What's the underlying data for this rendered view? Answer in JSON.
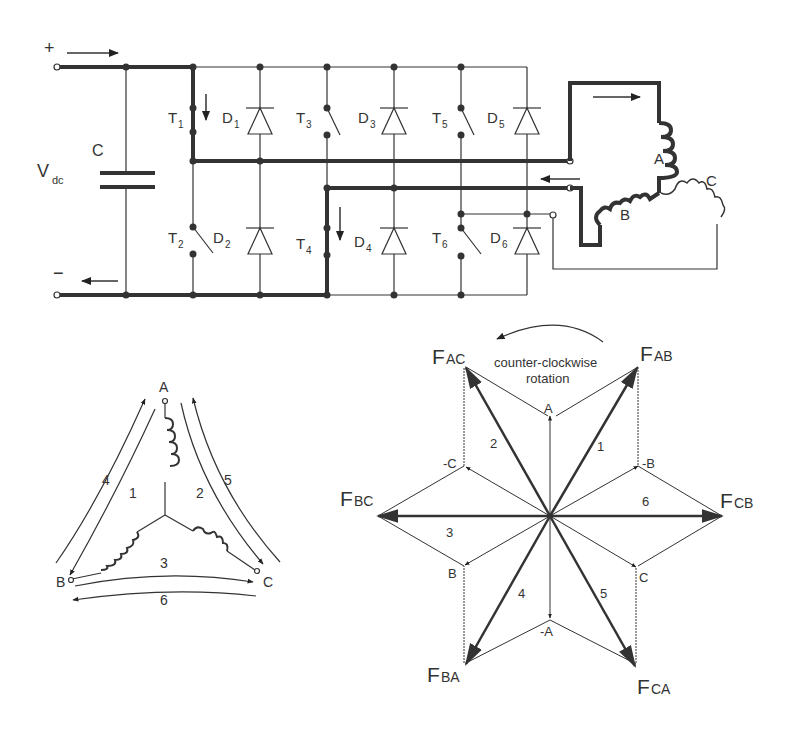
{
  "inverter": {
    "plus": "+",
    "minus": "−",
    "vdc": "V",
    "vdc_sub": "dc",
    "capacitor": "C",
    "switches": [
      {
        "name": "T",
        "sub": "1"
      },
      {
        "name": "T",
        "sub": "2"
      },
      {
        "name": "T",
        "sub": "3"
      },
      {
        "name": "T",
        "sub": "4"
      },
      {
        "name": "T",
        "sub": "5"
      },
      {
        "name": "T",
        "sub": "6"
      }
    ],
    "diodes": [
      {
        "name": "D",
        "sub": "1"
      },
      {
        "name": "D",
        "sub": "2"
      },
      {
        "name": "D",
        "sub": "3"
      },
      {
        "name": "D",
        "sub": "4"
      },
      {
        "name": "D",
        "sub": "5"
      },
      {
        "name": "D",
        "sub": "6"
      }
    ],
    "motor_phases": {
      "a": "A",
      "b": "B",
      "c": "C"
    }
  },
  "star_diagram": {
    "terminals": {
      "a": "A",
      "b": "B",
      "c": "C"
    },
    "paths": [
      "1",
      "2",
      "3",
      "4",
      "5",
      "6"
    ]
  },
  "vector_diagram": {
    "rotation_label_1": "counter-clockwise",
    "rotation_label_2": "rotation",
    "vectors": {
      "fab": {
        "main": "F",
        "sub": "AB"
      },
      "fac": {
        "main": "F",
        "sub": "AC"
      },
      "fbc": {
        "main": "F",
        "sub": "BC"
      },
      "fcb": {
        "main": "F",
        "sub": "CB"
      },
      "fba": {
        "main": "F",
        "sub": "BA"
      },
      "fca": {
        "main": "F",
        "sub": "CA"
      }
    },
    "phase_labels": {
      "a": "A",
      "neg_a": "-A",
      "b": "B",
      "neg_b": "-B",
      "c": "C",
      "neg_c": "-C"
    },
    "sectors": [
      "1",
      "2",
      "3",
      "4",
      "5",
      "6"
    ]
  }
}
